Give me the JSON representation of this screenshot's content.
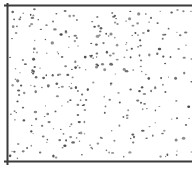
{
  "figure": {
    "pattern": "stipple",
    "colors": {
      "background": "#ffffff",
      "line": "#3a3a3a",
      "dot": "#4a4a4a"
    },
    "borders": {
      "top": {
        "x1": 5,
        "y1": 5.5,
        "x2": 192,
        "y2": 5.5,
        "width": 2
      },
      "left": {
        "x1": 7.5,
        "y1": 4,
        "x2": 7.5,
        "y2": 164,
        "width": 2
      },
      "bottom": {
        "x1": 5,
        "y1": 161.5,
        "x2": 192,
        "y2": 161.5,
        "width": 2
      }
    },
    "fill_region": {
      "x": 10,
      "y": 9,
      "width": 182,
      "height": 150
    },
    "stipple": {
      "count": 330,
      "seed": 7,
      "min_r": 0.6,
      "max_r": 1.4
    }
  }
}
